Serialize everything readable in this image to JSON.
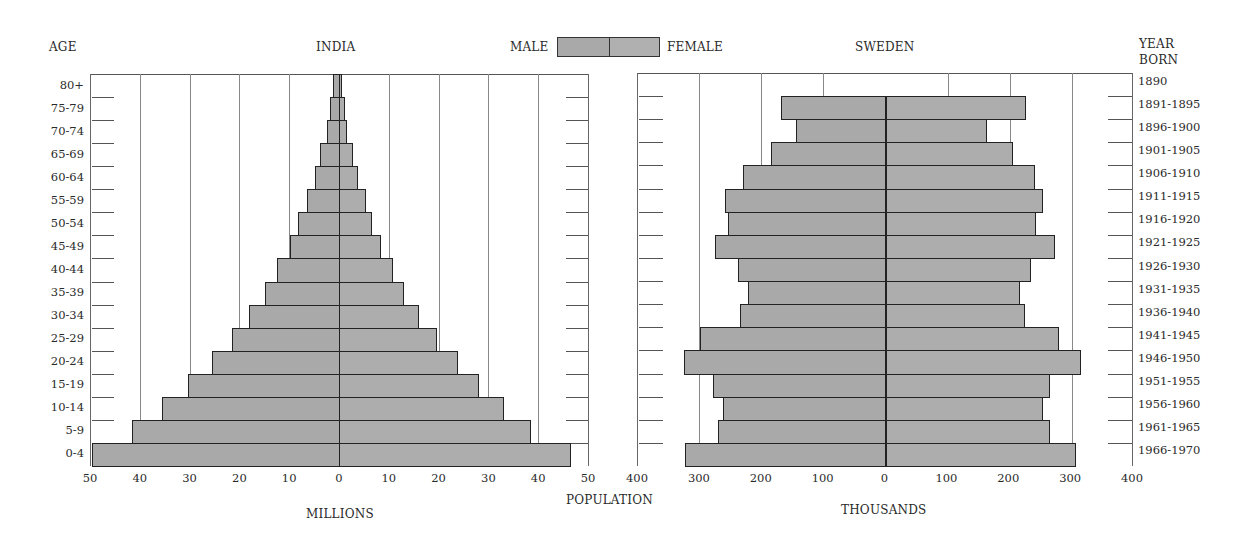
{
  "header": {
    "age_label": "AGE",
    "india_title": "INDIA",
    "sweden_title": "SWEDEN",
    "legend": {
      "male": "MALE",
      "female": "FEMALE"
    },
    "year_born_label_1": "YEAR",
    "year_born_label_2": "BORN"
  },
  "footer": {
    "population_label": "POPULATION",
    "india_unit": "MILLIONS",
    "sweden_unit": "THOUSANDS"
  },
  "colors": {
    "bar_fill": "#a9a9a9",
    "bar_edge": "#222222",
    "grid": "#888888"
  },
  "chart_data": [
    {
      "type": "bar",
      "orientation": "horizontal-population-pyramid",
      "title": "INDIA",
      "xlabel": "MILLIONS",
      "ylabel": "AGE",
      "xlim": [
        -50,
        50
      ],
      "x_ticks": [
        "50",
        "40",
        "30",
        "20",
        "10",
        "0",
        "10",
        "20",
        "30",
        "40",
        "50"
      ],
      "grid": true,
      "legend": [
        "MALE",
        "FEMALE"
      ],
      "legend_position": "top-center",
      "categories": [
        "80+",
        "75-79",
        "70-74",
        "65-69",
        "60-64",
        "55-59",
        "50-54",
        "45-49",
        "40-44",
        "35-39",
        "30-34",
        "25-29",
        "20-24",
        "15-19",
        "10-14",
        "5-9",
        "0-4"
      ],
      "series": [
        {
          "name": "MALE",
          "values": [
            1.2,
            1.8,
            2.4,
            3.8,
            4.8,
            6.4,
            8.2,
            9.8,
            12.5,
            14.8,
            18.0,
            21.4,
            25.6,
            30.4,
            35.6,
            41.6,
            49.6
          ]
        },
        {
          "name": "FEMALE",
          "values": [
            0.6,
            1.2,
            1.6,
            2.8,
            3.8,
            5.5,
            6.7,
            8.5,
            10.8,
            13.1,
            16.1,
            19.6,
            23.8,
            28.2,
            33.2,
            38.6,
            46.6
          ]
        }
      ]
    },
    {
      "type": "bar",
      "orientation": "horizontal-population-pyramid",
      "title": "SWEDEN",
      "xlabel": "THOUSANDS",
      "ylabel": "YEAR BORN",
      "xlim": [
        -400,
        400
      ],
      "x_ticks": [
        "400",
        "300",
        "200",
        "100",
        "0",
        "100",
        "200",
        "300",
        "400"
      ],
      "grid": true,
      "legend": [
        "MALE",
        "FEMALE"
      ],
      "categories": [
        "1890",
        "1891-1895",
        "1896-1900",
        "1901-1905",
        "1906-1910",
        "1911-1915",
        "1916-1920",
        "1921-1925",
        "1926-1930",
        "1931-1935",
        "1936-1940",
        "1941-1945",
        "1946-1950",
        "1951-1955",
        "1956-1960",
        "1961-1965",
        "1966-1970"
      ],
      "series": [
        {
          "name": "MALE",
          "values": [
            0,
            168,
            144,
            184,
            229,
            258,
            253,
            274,
            238,
            222,
            235,
            298,
            325,
            278,
            262,
            270,
            323
          ]
        },
        {
          "name": "FEMALE",
          "values": [
            0,
            226,
            163,
            205,
            240,
            254,
            243,
            273,
            234,
            216,
            224,
            279,
            315,
            264,
            253,
            264,
            306
          ]
        }
      ]
    }
  ]
}
